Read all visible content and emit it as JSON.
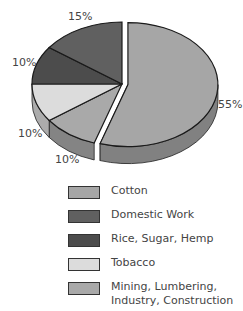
{
  "chart_data": {
    "type": "pie",
    "title": "",
    "style": "3d-exploded",
    "categories": [
      "Cotton",
      "Mining, Lumbering, Industry, Construction",
      "Tobacco",
      "Rice, Sugar, Hemp",
      "Domestic Work"
    ],
    "values": [
      55,
      10,
      10,
      10,
      15
    ],
    "unit": "%",
    "colors": [
      "#a6a6a6",
      "#a9a9a9",
      "#dcdcdc",
      "#4c4c4c",
      "#606060"
    ],
    "exploded": [
      "Cotton"
    ],
    "legend_position": "bottom"
  },
  "labels": {
    "cotton": "55%",
    "mining": "10%",
    "tobacco": "10%",
    "rice": "10%",
    "domestic": "15%"
  },
  "legend": [
    {
      "label": "Cotton",
      "color": "#a6a6a6"
    },
    {
      "label": "Domestic Work",
      "color": "#606060"
    },
    {
      "label": "Rice, Sugar, Hemp",
      "color": "#4c4c4c"
    },
    {
      "label": "Tobacco",
      "color": "#dcdcdc"
    },
    {
      "label": "Mining, Lumbering,\nIndustry, Construction",
      "color": "#a9a9a9"
    }
  ]
}
